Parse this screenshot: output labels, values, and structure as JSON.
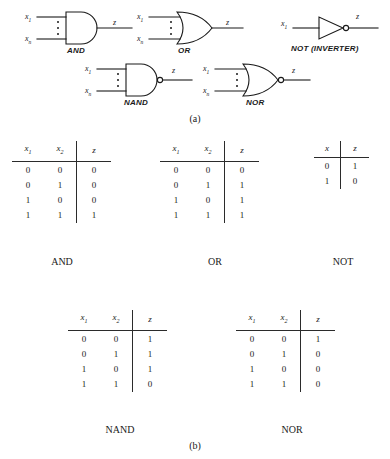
{
  "figure": {
    "part_a_caption": "(a)",
    "part_b_caption": "(b)"
  },
  "gates": [
    {
      "name": "AND",
      "label": "AND",
      "inputs": [
        "x1",
        "xn"
      ],
      "output": "z",
      "bubble": false,
      "shape": "and"
    },
    {
      "name": "OR",
      "label": "OR",
      "inputs": [
        "x1",
        "xn"
      ],
      "output": "z",
      "bubble": false,
      "shape": "or"
    },
    {
      "name": "NOT (INVERTER)",
      "label": "NOT (INVERTER)",
      "inputs": [
        "x1"
      ],
      "output": "z",
      "bubble": true,
      "shape": "not"
    },
    {
      "name": "NAND",
      "label": "NAND",
      "inputs": [
        "x1",
        "xn"
      ],
      "output": "z",
      "bubble": true,
      "shape": "and"
    },
    {
      "name": "NOR",
      "label": "NOR",
      "inputs": [
        "x1",
        "xn"
      ],
      "output": "z",
      "bubble": true,
      "shape": "or"
    }
  ],
  "port_labels": {
    "x1_base": "x",
    "x1_sub": "1",
    "xn_base": "x",
    "xn_sub": "n",
    "z": "z",
    "x": "x"
  },
  "tables": [
    {
      "name": "AND",
      "title": "AND",
      "headers": [
        "x",
        "x",
        "z"
      ],
      "header_subs": [
        "1",
        "2",
        ""
      ],
      "rows": [
        [
          "0",
          "0",
          "0"
        ],
        [
          "0",
          "1",
          "0"
        ],
        [
          "1",
          "0",
          "0"
        ],
        [
          "1",
          "1",
          "1"
        ]
      ]
    },
    {
      "name": "OR",
      "title": "OR",
      "headers": [
        "x",
        "x",
        "z"
      ],
      "header_subs": [
        "1",
        "2",
        ""
      ],
      "rows": [
        [
          "0",
          "0",
          "0"
        ],
        [
          "0",
          "1",
          "1"
        ],
        [
          "1",
          "0",
          "1"
        ],
        [
          "1",
          "1",
          "1"
        ]
      ]
    },
    {
      "name": "NOT",
      "title": "NOT",
      "headers": [
        "x",
        "z"
      ],
      "header_subs": [
        "",
        ""
      ],
      "rows": [
        [
          "0",
          "1"
        ],
        [
          "1",
          "0"
        ]
      ]
    },
    {
      "name": "NAND",
      "title": "NAND",
      "headers": [
        "x",
        "x",
        "z"
      ],
      "header_subs": [
        "1",
        "2",
        ""
      ],
      "rows": [
        [
          "0",
          "0",
          "1"
        ],
        [
          "0",
          "1",
          "1"
        ],
        [
          "1",
          "0",
          "1"
        ],
        [
          "1",
          "1",
          "0"
        ]
      ]
    },
    {
      "name": "NOR",
      "title": "NOR",
      "headers": [
        "x",
        "x",
        "z"
      ],
      "header_subs": [
        "1",
        "2",
        ""
      ],
      "rows": [
        [
          "0",
          "0",
          "1"
        ],
        [
          "0",
          "1",
          "0"
        ],
        [
          "1",
          "0",
          "0"
        ],
        [
          "1",
          "1",
          "0"
        ]
      ]
    }
  ],
  "colors": {
    "ink": "#1a1a1a",
    "rule": "#2b2b2b",
    "background": "#ffffff"
  }
}
